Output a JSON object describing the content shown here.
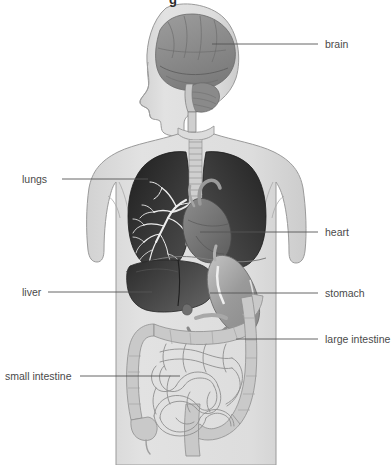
{
  "figure": {
    "title_fragment": "g",
    "width": 391,
    "height": 465,
    "background_color": "#ffffff",
    "view": "anterior-full-body-silhouette"
  },
  "palette": {
    "background": "#ffffff",
    "body_silhouette": "#dcdcdc",
    "body_outline": "#9a9a9a",
    "lung_dark": "#2e2e2e",
    "lung_mid": "#4a4a4a",
    "bronchi_white": "#f2f2f2",
    "heart_gray": "#6e6e6e",
    "liver_dark": "#3a3a3a",
    "liver_mid": "#585858",
    "stomach_gray": "#9e9e9e",
    "stomach_highlight": "#f0f0f0",
    "intestine_fill": "#c9c9c9",
    "intestine_light": "#e2e2e2",
    "brain_gray": "#8e8e8e",
    "brain_dark": "#777777",
    "spine_gray": "#b5b5b5",
    "leader_line": "#555555",
    "label_text": "#4a4a4a"
  },
  "labels": [
    {
      "id": "brain",
      "text": "brain",
      "side": "right",
      "text_x": 325,
      "text_y": 44,
      "line_from_x": 212,
      "line_from_y": 44,
      "line_to_x": 318,
      "line_to_y": 44
    },
    {
      "id": "lungs",
      "text": "lungs",
      "side": "left",
      "text_x": 22,
      "text_y": 183,
      "line_from_x": 62,
      "line_from_y": 179,
      "line_to_x": 148,
      "line_to_y": 179
    },
    {
      "id": "heart",
      "text": "heart",
      "side": "right",
      "text_x": 325,
      "text_y": 236,
      "line_from_x": 200,
      "line_from_y": 232,
      "line_to_x": 318,
      "line_to_y": 232
    },
    {
      "id": "liver",
      "text": "liver",
      "side": "left",
      "text_x": 22,
      "text_y": 296,
      "line_from_x": 48,
      "line_from_y": 292,
      "line_to_x": 152,
      "line_to_y": 292
    },
    {
      "id": "stomach",
      "text": "stomach",
      "side": "right",
      "text_x": 325,
      "text_y": 297,
      "line_from_x": 210,
      "line_from_y": 293,
      "line_to_x": 318,
      "line_to_y": 293
    },
    {
      "id": "large-intestine",
      "text": "large intestine",
      "side": "right",
      "text_x": 325,
      "text_y": 343,
      "line_from_x": 236,
      "line_from_y": 339,
      "line_to_x": 318,
      "line_to_y": 339
    },
    {
      "id": "small-intestine",
      "text": "small intestine",
      "side": "left",
      "text_x": 5,
      "text_y": 380,
      "line_from_x": 80,
      "line_from_y": 376,
      "line_to_x": 180,
      "line_to_y": 376
    }
  ],
  "organs": [
    {
      "id": "brain",
      "name": "brain",
      "region": "head"
    },
    {
      "id": "lungs",
      "name": "lungs",
      "region": "thorax"
    },
    {
      "id": "heart",
      "name": "heart",
      "region": "thorax"
    },
    {
      "id": "liver",
      "name": "liver",
      "region": "abdomen"
    },
    {
      "id": "stomach",
      "name": "stomach",
      "region": "abdomen"
    },
    {
      "id": "large-intestine",
      "name": "large intestine",
      "region": "abdomen"
    },
    {
      "id": "small-intestine",
      "name": "small intestine",
      "region": "abdomen"
    }
  ]
}
